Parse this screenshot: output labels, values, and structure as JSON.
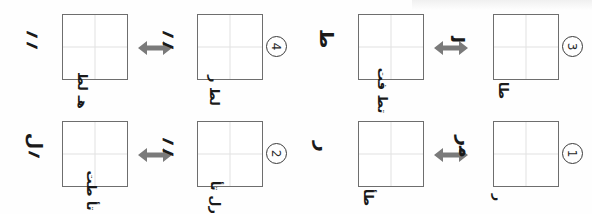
{
  "page": {
    "background_color": "#fefefe",
    "box_border_color": "#6e6e6e",
    "grid_line_color": "#e2e2e2",
    "arrow_color": "#7a7a7a",
    "ink_color": "#1a1a1a",
    "rows": 2,
    "columns": 2
  },
  "panels": [
    {
      "index_label": "4",
      "position": "top-left",
      "left_item": {
        "side_mark": "؍؍",
        "box_under_marks": "ﻫـ ﻟﻂ"
      },
      "right_item": {
        "side_mark": "؍؍",
        "box_under_marks": "ﻟﻂ ﺭ"
      },
      "relation_symbol": "double-headed-arrow"
    },
    {
      "index_label": "3",
      "position": "top-right",
      "left_item": {
        "side_mark": "ﻃ",
        "box_under_marks": "ﺗﻂ ﻓﺖ"
      },
      "right_item": {
        "side_mark": "ﻟ",
        "box_under_marks": "ﻃﺎ"
      },
      "relation_symbol": "double-headed-arrow"
    },
    {
      "index_label": "2",
      "position": "bottom-left",
      "left_item": {
        "side_mark": "؍ﻝ",
        "box_under_marks": "ﺝ ﺗﺄ ﻃﺖ"
      },
      "right_item": {
        "side_mark": "؍؍",
        "box_under_marks": "ﺭﻝ ﺗﺄ"
      },
      "relation_symbol": "double-headed-arrow"
    },
    {
      "index_label": "1",
      "position": "bottom-right",
      "left_item": {
        "side_mark": "ﺭ",
        "box_under_marks": "ﻃﺄ"
      },
      "right_item": {
        "side_mark": "ﻣﺭ",
        "box_under_marks": "ﺭ"
      },
      "relation_symbol": "double-headed-arrow"
    }
  ]
}
